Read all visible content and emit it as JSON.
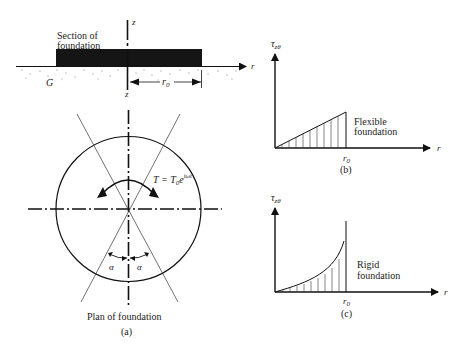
{
  "panel_a": {
    "section_label_line1": "Section of",
    "section_label_line2": "foundation",
    "z_top": "z",
    "z_bottom": "z",
    "r_axis": "r",
    "soil_label": "G",
    "radius_label": "r",
    "radius_sub": "0",
    "torque_T": "T = T",
    "torque_sub": "0",
    "torque_e": "e",
    "torque_exp": "iωt",
    "alpha_left": "α",
    "alpha_right": "α",
    "plan_label": "Plan of foundation",
    "caption": "(a)"
  },
  "panel_b": {
    "y_axis_tau": "τ",
    "y_axis_sub": "zθ",
    "x_axis": "r",
    "r0": "r",
    "r0_sub": "0",
    "label_line1": "Flexible",
    "label_line2": "foundation",
    "caption": "(b)"
  },
  "panel_c": {
    "y_axis_tau": "τ",
    "y_axis_sub": "zθ",
    "x_axis": "r",
    "r0": "r",
    "r0_sub": "0",
    "label_line1": "Rigid",
    "label_line2": "foundation",
    "caption": "(c)"
  }
}
